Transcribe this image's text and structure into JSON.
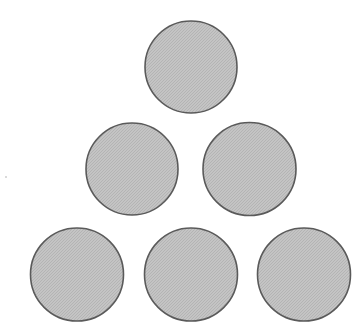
{
  "diagram": {
    "type": "triangular-circle-arrangement",
    "rows": [
      1,
      2,
      3
    ],
    "total_circles": 6,
    "colors": {
      "background": "#ffffff",
      "circle_fill": "#c4c4c4",
      "circle_fill_speckle": "#b4b4b4",
      "circle_stroke": "#5a5a5a",
      "speck": "#999999"
    },
    "circles": [
      {
        "id": "top",
        "row": 1,
        "cx": 191,
        "cy": 67,
        "r": 46
      },
      {
        "id": "middle-left",
        "row": 2,
        "cx": 132,
        "cy": 169,
        "r": 46
      },
      {
        "id": "middle-right",
        "row": 2,
        "cx": 249.5,
        "cy": 169,
        "r": 46.5
      },
      {
        "id": "bottom-left",
        "row": 3,
        "cx": 77,
        "cy": 274.5,
        "r": 46.5
      },
      {
        "id": "bottom-middle",
        "row": 3,
        "cx": 191,
        "cy": 274.5,
        "r": 46.5
      },
      {
        "id": "bottom-right",
        "row": 3,
        "cx": 304,
        "cy": 274.5,
        "r": 46.5
      }
    ],
    "stray_mark": {
      "x": 6,
      "y": 177
    }
  }
}
